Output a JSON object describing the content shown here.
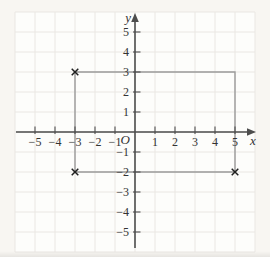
{
  "figure": {
    "colors": {
      "paper": "#f8f6f2",
      "plot_bg": "#fdfdfb",
      "grid": "#eae7e3",
      "axis": "#4d4d4d",
      "shape": "#9b9b9b",
      "marker": "#1f1f1f",
      "text": "#333333"
    }
  },
  "chart_data": {
    "type": "scatter",
    "title": "",
    "xlabel": "x",
    "ylabel": "y",
    "origin_label": "O",
    "xlim": [
      -6,
      6
    ],
    "ylim": [
      -6,
      6
    ],
    "grid": true,
    "legend": false,
    "x_ticks": [
      {
        "v": -5,
        "label": "−5"
      },
      {
        "v": -4,
        "label": "−4"
      },
      {
        "v": -3,
        "label": "−3"
      },
      {
        "v": -2,
        "label": "−2"
      },
      {
        "v": -1,
        "label": "−1"
      },
      {
        "v": 1,
        "label": "1"
      },
      {
        "v": 2,
        "label": "2"
      },
      {
        "v": 3,
        "label": "3"
      },
      {
        "v": 4,
        "label": "4"
      },
      {
        "v": 5,
        "label": "5"
      }
    ],
    "y_ticks": [
      {
        "v": 5,
        "label": "5"
      },
      {
        "v": 4,
        "label": "4"
      },
      {
        "v": 3,
        "label": "3"
      },
      {
        "v": 2,
        "label": "2"
      },
      {
        "v": 1,
        "label": "1"
      },
      {
        "v": -1,
        "label": "−1"
      },
      {
        "v": -2,
        "label": "−2"
      },
      {
        "v": -3,
        "label": "−3"
      },
      {
        "v": -4,
        "label": "−4"
      },
      {
        "v": -5,
        "label": "−5"
      }
    ],
    "shapes": [
      {
        "type": "rectangle",
        "vertices": [
          [
            -3,
            3
          ],
          [
            5,
            3
          ],
          [
            5,
            -2
          ],
          [
            -3,
            -2
          ]
        ]
      }
    ],
    "points": [
      {
        "x": -3,
        "y": 3,
        "marker": "x"
      },
      {
        "x": -3,
        "y": -2,
        "marker": "x"
      },
      {
        "x": 5,
        "y": -2,
        "marker": "x"
      }
    ]
  }
}
